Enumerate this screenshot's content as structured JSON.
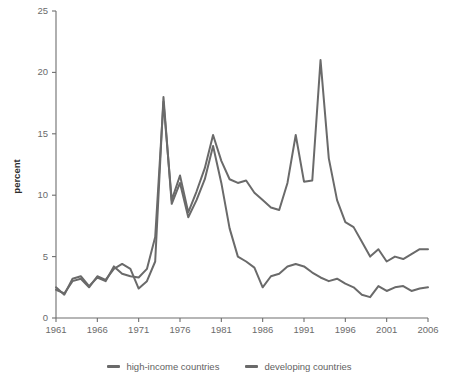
{
  "chart_data": {
    "type": "line",
    "title": "",
    "xlabel": "",
    "ylabel": "percent",
    "xlim": [
      1961,
      2006
    ],
    "ylim": [
      0,
      25
    ],
    "grid": false,
    "legend_position": "bottom",
    "xticks": [
      1961,
      1966,
      1971,
      1976,
      1981,
      1986,
      1991,
      1996,
      2001,
      2006
    ],
    "yticks": [
      0,
      5,
      10,
      15,
      20,
      25
    ],
    "x": [
      1961,
      1962,
      1963,
      1964,
      1965,
      1966,
      1967,
      1968,
      1969,
      1970,
      1971,
      1972,
      1973,
      1974,
      1975,
      1976,
      1977,
      1978,
      1979,
      1980,
      1981,
      1982,
      1983,
      1984,
      1985,
      1986,
      1987,
      1988,
      1989,
      1990,
      1991,
      1992,
      1993,
      1994,
      1995,
      1996,
      1997,
      1998,
      1999,
      2000,
      2001,
      2002,
      2003,
      2004,
      2005,
      2006
    ],
    "series": [
      {
        "name": "high-income countries",
        "color": "#6a6a6a",
        "values": [
          2.3,
          2.1,
          3.1,
          3.3,
          2.8,
          3.5,
          3.2,
          3.7,
          4.3,
          4.1,
          3.6,
          3.4,
          5.2,
          7.7,
          11.8,
          11.1,
          9.4,
          8.1,
          8.6,
          12.2,
          12.0,
          11.3,
          8.1,
          5.9,
          5.3,
          4.6,
          4.6,
          4.2,
          4.5,
          4.6,
          4.0,
          3.8,
          3.5,
          2.9,
          2.5,
          2.9,
          3.0,
          2.8,
          2.5,
          2.6,
          2.4,
          2.2,
          2.3,
          2.4,
          2.5,
          2.5
        ]
      },
      {
        "name": "developing countries",
        "color": "#6a6a6a",
        "values": [
          2.4,
          2.0,
          2.9,
          3.5,
          2.7,
          3.4,
          3.0,
          4.0,
          4.2,
          3.1,
          3.8,
          4.1,
          6.0,
          9.0,
          12.3,
          11.4,
          9.8,
          8.6,
          9.1,
          12.7,
          12.3,
          11.5,
          9.3,
          8.3,
          7.1,
          6.9,
          6.7,
          6.3,
          6.3,
          7.0,
          6.7,
          6.4,
          6.2,
          6.0,
          5.8,
          5.6,
          5.4,
          5.3,
          5.1,
          5.2,
          5.0,
          5.1,
          5.3,
          5.4,
          5.5,
          5.6
        ]
      }
    ],
    "series_detailed": {
      "high-income countries": {
        "peaks": [
          {
            "year": 1974,
            "value": 18.0
          },
          {
            "year": 1980,
            "value": 14.0
          }
        ],
        "troughs": [
          {
            "year": 1986,
            "value": 2.5
          }
        ],
        "end_value": 2.5
      },
      "developing countries": {
        "peaks": [
          {
            "year": 1974,
            "value": 17.6
          },
          {
            "year": 1980,
            "value": 14.9
          },
          {
            "year": 1990,
            "value": 14.9
          },
          {
            "year": 1994,
            "value": 21.0
          }
        ],
        "troughs": [
          {
            "year": 1988,
            "value": 8.8
          }
        ],
        "end_value": 5.6
      }
    },
    "points_high_income": [
      [
        1961,
        2.3
      ],
      [
        1962,
        2.0
      ],
      [
        1963,
        3.0
      ],
      [
        1964,
        3.2
      ],
      [
        1965,
        2.5
      ],
      [
        1966,
        3.4
      ],
      [
        1967,
        3.1
      ],
      [
        1968,
        4.0
      ],
      [
        1969,
        4.4
      ],
      [
        1970,
        4.0
      ],
      [
        1971,
        2.4
      ],
      [
        1972,
        3.0
      ],
      [
        1973,
        4.6
      ],
      [
        1974,
        18.0
      ],
      [
        1975,
        9.3
      ],
      [
        1976,
        11.0
      ],
      [
        1977,
        8.2
      ],
      [
        1978,
        9.6
      ],
      [
        1979,
        11.3
      ],
      [
        1980,
        14.0
      ],
      [
        1981,
        11.0
      ],
      [
        1982,
        7.3
      ],
      [
        1983,
        5.0
      ],
      [
        1984,
        4.6
      ],
      [
        1985,
        4.1
      ],
      [
        1986,
        2.5
      ],
      [
        1987,
        3.4
      ],
      [
        1988,
        3.6
      ],
      [
        1989,
        4.2
      ],
      [
        1990,
        4.4
      ],
      [
        1991,
        4.2
      ],
      [
        1992,
        3.7
      ],
      [
        1993,
        3.3
      ],
      [
        1994,
        3.0
      ],
      [
        1995,
        3.2
      ],
      [
        1996,
        2.8
      ],
      [
        1997,
        2.5
      ],
      [
        1998,
        1.9
      ],
      [
        1999,
        1.7
      ],
      [
        2000,
        2.6
      ],
      [
        2001,
        2.2
      ],
      [
        2002,
        2.5
      ],
      [
        2003,
        2.6
      ],
      [
        2004,
        2.2
      ],
      [
        2005,
        2.4
      ],
      [
        2006,
        2.5
      ]
    ],
    "points_developing": [
      [
        1961,
        2.5
      ],
      [
        1962,
        1.9
      ],
      [
        1963,
        3.2
      ],
      [
        1964,
        3.4
      ],
      [
        1965,
        2.6
      ],
      [
        1966,
        3.3
      ],
      [
        1967,
        3.0
      ],
      [
        1968,
        4.2
      ],
      [
        1969,
        3.6
      ],
      [
        1970,
        3.4
      ],
      [
        1971,
        3.3
      ],
      [
        1972,
        4.0
      ],
      [
        1973,
        6.6
      ],
      [
        1974,
        17.6
      ],
      [
        1975,
        9.6
      ],
      [
        1976,
        11.6
      ],
      [
        1977,
        8.6
      ],
      [
        1978,
        10.3
      ],
      [
        1979,
        12.2
      ],
      [
        1980,
        14.9
      ],
      [
        1981,
        12.8
      ],
      [
        1982,
        11.3
      ],
      [
        1983,
        11.0
      ],
      [
        1984,
        11.2
      ],
      [
        1985,
        10.2
      ],
      [
        1986,
        9.6
      ],
      [
        1987,
        9.0
      ],
      [
        1988,
        8.8
      ],
      [
        1989,
        11.0
      ],
      [
        1990,
        14.9
      ],
      [
        1991,
        11.1
      ],
      [
        1992,
        11.2
      ],
      [
        1993,
        21.0
      ],
      [
        1994,
        13.0
      ],
      [
        1995,
        9.6
      ],
      [
        1996,
        7.8
      ],
      [
        1997,
        7.4
      ],
      [
        1998,
        6.2
      ],
      [
        1999,
        5.0
      ],
      [
        2000,
        5.6
      ],
      [
        2001,
        4.6
      ],
      [
        2002,
        5.0
      ],
      [
        2003,
        4.8
      ],
      [
        2004,
        5.2
      ],
      [
        2005,
        5.6
      ],
      [
        2006,
        5.6
      ]
    ]
  },
  "axes": {
    "ylabel": "percent",
    "ytick_labels": [
      "0",
      "5",
      "10",
      "15",
      "20",
      "25"
    ],
    "xtick_labels": [
      "1961",
      "1966",
      "1971",
      "1976",
      "1981",
      "1986",
      "1991",
      "1996",
      "2001",
      "2006"
    ]
  },
  "legend": {
    "items": [
      {
        "label": "high-income countries",
        "color": "#6a6a6a"
      },
      {
        "label": "developing countries",
        "color": "#6a6a6a"
      }
    ]
  },
  "colors": {
    "axis": "#6e6e6e",
    "tick_text": "#6b6b6b",
    "axis_title": "#2b2b2b",
    "line_high_income": "#6a6a6a",
    "line_developing": "#6a6a6a",
    "background": "#ffffff"
  }
}
